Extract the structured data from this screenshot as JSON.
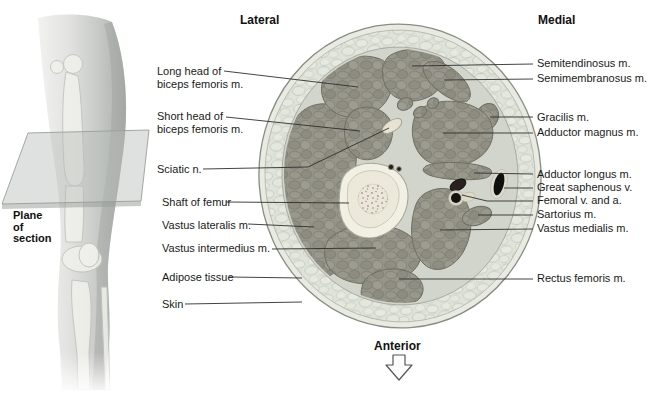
{
  "titles": {
    "lateral": "Lateral",
    "medial": "Medial",
    "anterior": "Anterior"
  },
  "plane_of_section": {
    "lines": [
      "Plane",
      "of",
      "section"
    ]
  },
  "labels": {
    "left": [
      {
        "id": "long-head-biceps-femoris",
        "lines": [
          "Long head of",
          "biceps femoris m."
        ]
      },
      {
        "id": "short-head-biceps-femoris",
        "lines": [
          "Short head of",
          "biceps femoris m."
        ]
      },
      {
        "id": "sciatic-nerve",
        "lines": [
          "Sciatic n."
        ]
      },
      {
        "id": "shaft-of-femur",
        "lines": [
          "Shaft of femur"
        ]
      },
      {
        "id": "vastus-lateralis",
        "lines": [
          "Vastus lateralis m."
        ]
      },
      {
        "id": "vastus-intermedius",
        "lines": [
          "Vastus intermedius m."
        ]
      },
      {
        "id": "adipose-tissue",
        "lines": [
          "Adipose tissue"
        ]
      },
      {
        "id": "skin",
        "lines": [
          "Skin"
        ]
      }
    ],
    "right": [
      {
        "id": "semitendinosus",
        "text": "Semitendinosus m."
      },
      {
        "id": "semimembranosus",
        "text": "Semimembranosus m."
      },
      {
        "id": "gracilis",
        "text": "Gracilis m."
      },
      {
        "id": "adductor-magnus",
        "text": "Adductor magnus m."
      },
      {
        "id": "adductor-longus",
        "text": "Adductor longus m."
      },
      {
        "id": "great-saphenous-vein",
        "text": "Great saphenous v."
      },
      {
        "id": "femoral-vein-artery",
        "text": "Femoral v. and a."
      },
      {
        "id": "sartorius",
        "text": "Sartorius m."
      },
      {
        "id": "vastus-medialis",
        "text": "Vastus medialis m."
      },
      {
        "id": "rectus-femoris",
        "text": "Rectus femoris m."
      }
    ]
  },
  "colors": {
    "muscle": "#96958a",
    "muscle_outline": "#6f6e63",
    "deep_fascia": "#d2d5cc",
    "adipose": "#e0e3da",
    "skin_ring": "#e9ebe3",
    "bone_cortex": "#f1f0e2",
    "bone_marrow": "#e9e5d8",
    "nerve": "#e6e3d2",
    "vessel_dark": "#141210",
    "leader_line": "#2f2f2f",
    "text": "#1a1a1a"
  }
}
